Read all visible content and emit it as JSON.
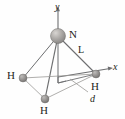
{
  "figure": {
    "type": "molecular-geometry-diagram",
    "molecule": "NH3",
    "colors": {
      "line": "#6d6e70",
      "text": "#231f20",
      "nitrogen_sphere": "#a8a5a2",
      "hydrogen_sphere": "#8c8a88",
      "background": "#fefefe"
    }
  },
  "atoms": [
    {
      "id": "nitrogen",
      "label": "N",
      "element": "N",
      "x": 58,
      "y": 36,
      "radius": 7.5,
      "label_x": 69,
      "label_y": 30
    },
    {
      "id": "hydrogen-left",
      "label": "H",
      "element": "H",
      "x": 23,
      "y": 78,
      "radius": 4,
      "label_x": 8,
      "label_y": 72
    },
    {
      "id": "hydrogen-right",
      "label": "H",
      "element": "H",
      "x": 96,
      "y": 74,
      "radius": 4,
      "label_x": 92,
      "label_y": 82
    },
    {
      "id": "hydrogen-front",
      "label": "H",
      "element": "H",
      "x": 45,
      "y": 99,
      "radius": 4,
      "label_x": 40,
      "label_y": 106
    }
  ],
  "axes": [
    {
      "id": "y-axis",
      "label": "y",
      "label_x": 55,
      "label_y": 2
    },
    {
      "id": "x-axis",
      "label": "x",
      "label_x": 113,
      "label_y": 63
    }
  ],
  "dimensions": [
    {
      "id": "bond-length",
      "label": "L",
      "label_x": 78,
      "label_y": 46,
      "italic": false
    },
    {
      "id": "distance-d",
      "label": "d",
      "label_x": 90,
      "label_y": 95,
      "italic": true
    }
  ]
}
